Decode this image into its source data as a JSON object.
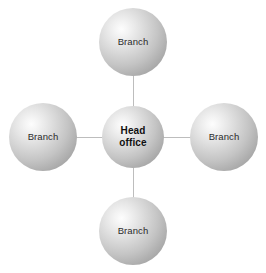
{
  "diagram": {
    "type": "hub-and-spoke",
    "background_color": "#ffffff",
    "width": 266,
    "height": 273,
    "center_node": {
      "label_line_1": "Head",
      "label_line_2": "office",
      "label": "Head office",
      "shape": "sphere",
      "font_weight": "bold",
      "diameter": 62,
      "center_x": 133,
      "center_y": 137,
      "fill_highlight_color": "#fdfdfd",
      "fill_shadow_color": "#8c8c8c",
      "text_color": "#101010"
    },
    "spoke_nodes": [
      {
        "position": "top",
        "label": "Branch",
        "shape": "sphere",
        "diameter": 68,
        "center_x": 133,
        "center_y": 42,
        "text_color": "#2b2b2b"
      },
      {
        "position": "left",
        "label": "Branch",
        "shape": "sphere",
        "diameter": 68,
        "center_x": 43,
        "center_y": 137,
        "text_color": "#2b2b2b"
      },
      {
        "position": "right",
        "label": "Branch",
        "shape": "sphere",
        "diameter": 68,
        "center_x": 224,
        "center_y": 137,
        "text_color": "#2b2b2b"
      },
      {
        "position": "bottom",
        "label": "Branch",
        "shape": "sphere",
        "diameter": 68,
        "center_x": 133,
        "center_y": 231,
        "text_color": "#2b2b2b"
      }
    ],
    "connectors": [
      {
        "from": "center_node",
        "to": "top",
        "orientation": "vertical",
        "color": "#bdbdbd",
        "thickness": 1
      },
      {
        "from": "center_node",
        "to": "bottom",
        "orientation": "vertical",
        "color": "#bdbdbd",
        "thickness": 1
      },
      {
        "from": "center_node",
        "to": "left",
        "orientation": "horizontal",
        "color": "#bdbdbd",
        "thickness": 1
      },
      {
        "from": "center_node",
        "to": "right",
        "orientation": "horizontal",
        "color": "#bdbdbd",
        "thickness": 1
      }
    ]
  }
}
